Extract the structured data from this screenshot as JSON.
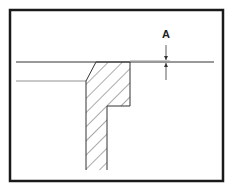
{
  "diagram": {
    "dimension_label": "A",
    "colors": {
      "frame": "#1a1a1a",
      "line": "#333333",
      "thin_line": "#666666",
      "gap_band": "#999999",
      "background": "#ffffff"
    }
  }
}
